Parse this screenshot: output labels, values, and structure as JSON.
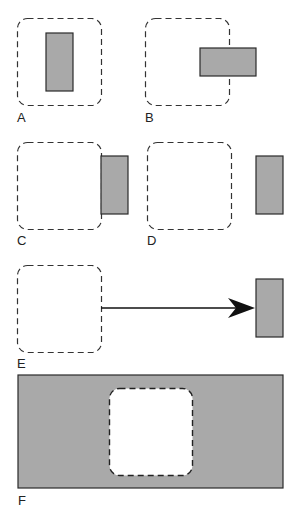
{
  "colors": {
    "block_fill": "#a9a9a9",
    "block_stroke": "#2a2a2a",
    "dash_stroke": "#333333",
    "background": "#ffffff"
  },
  "panels": [
    {
      "label": "A",
      "description": "block fully inside dashed region"
    },
    {
      "label": "B",
      "description": "block overlapping right edge of dashed region"
    },
    {
      "label": "C",
      "description": "block touching outside right edge of dashed region"
    },
    {
      "label": "D",
      "description": "block separated outside dashed region"
    },
    {
      "label": "E",
      "description": "block far from dashed region, connected by arrow"
    },
    {
      "label": "F",
      "description": "dashed region fully enclosed inside large block"
    }
  ]
}
